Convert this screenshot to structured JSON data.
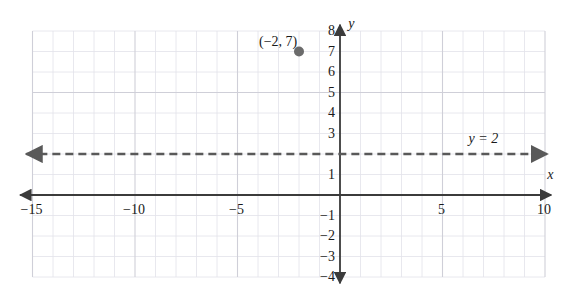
{
  "chart_data": {
    "type": "line",
    "title": "",
    "xlabel": "x",
    "ylabel": "y",
    "xlim": [
      -15.6,
      10.3
    ],
    "ylim": [
      -4.3,
      8.3
    ],
    "grid": true,
    "grid_minor_step": 1,
    "grid_major_step": 5,
    "legend": "none",
    "x_ticks": [
      {
        "value": -15,
        "label": "−15"
      },
      {
        "value": -10,
        "label": "−10"
      },
      {
        "value": -5,
        "label": "−5"
      },
      {
        "value": 5,
        "label": "5"
      },
      {
        "value": 10,
        "label": "10"
      }
    ],
    "y_ticks": [
      {
        "value": 8,
        "label": "8"
      },
      {
        "value": 7,
        "label": "7"
      },
      {
        "value": 6,
        "label": "6"
      },
      {
        "value": 5,
        "label": "5"
      },
      {
        "value": 4,
        "label": "4"
      },
      {
        "value": 3,
        "label": "3"
      },
      {
        "value": 1,
        "label": "1"
      },
      {
        "value": -1,
        "label": "−1"
      },
      {
        "value": -2,
        "label": "−2"
      },
      {
        "value": -3,
        "label": "−3"
      },
      {
        "value": -4,
        "label": "−4"
      }
    ],
    "series": [
      {
        "name": "y = 2",
        "equation_label": "y = 2",
        "style": "dashed",
        "arrows": "both",
        "color": "#595959",
        "constant_y": 2,
        "x_start": -15.3,
        "x_end": 10.1
      }
    ],
    "points": [
      {
        "label": "(−2, 7)",
        "x": -2,
        "y": 7,
        "color": "#6b6b6b",
        "radius": 5
      }
    ],
    "annotations": [
      {
        "name": "line-equation",
        "text": "y = 2",
        "x": 7.0,
        "y": 2.75
      },
      {
        "name": "x-axis-name",
        "text": "x",
        "x": 10.25,
        "y": 1.0
      },
      {
        "name": "y-axis-name",
        "text": "y",
        "x": 0.55,
        "y": 8.35
      }
    ],
    "colors": {
      "axis": "#3b3b3b",
      "grid_minor": "#e2e2ea",
      "grid_major": "#cfcfd8",
      "line": "#595959",
      "point": "#6b6b6b",
      "background": "#ffffff"
    }
  }
}
